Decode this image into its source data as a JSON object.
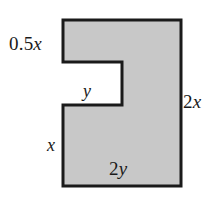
{
  "figure": {
    "type": "geometry-diagram",
    "background_color": "#ffffff",
    "fill_color": "#c8c8c8",
    "stroke_color": "#1a1a1a",
    "stroke_width": 3,
    "notch_fill_color": "#ffffff",
    "outline_points": "63,20 181,20 181,186 63,186 63,105 122,105 122,62 63,62",
    "labels": [
      {
        "id": "top-left-side",
        "prefix": "0.5",
        "variable": "x",
        "text": "0.5x",
        "position": "left of upper-left vertical edge"
      },
      {
        "id": "notch-depth",
        "prefix": "",
        "variable": "y",
        "text": "y",
        "position": "inside notch, above notch bottom edge"
      },
      {
        "id": "lower-left-side",
        "prefix": "",
        "variable": "x",
        "text": "x",
        "position": "left of lower-left vertical edge"
      },
      {
        "id": "right-side",
        "prefix": "2",
        "variable": "x",
        "text": "2x",
        "position": "right of right vertical edge"
      },
      {
        "id": "bottom-side",
        "prefix": "2",
        "variable": "y",
        "text": "2y",
        "position": "inside shape, above bottom edge"
      }
    ]
  }
}
